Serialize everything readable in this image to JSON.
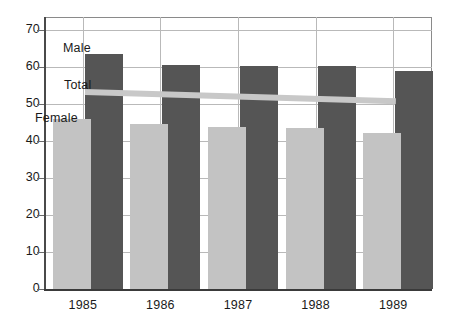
{
  "chart_data": {
    "type": "bar",
    "title": "",
    "subtitle": "",
    "xlabel": "",
    "ylabel": "",
    "categories": [
      "1985",
      "1986",
      "1987",
      "1988",
      "1989"
    ],
    "ylim": [
      0,
      70
    ],
    "yticks": [
      0,
      10,
      20,
      30,
      40,
      50,
      60,
      70
    ],
    "ytick_labels": [
      "0",
      "10",
      "20",
      "30",
      "40",
      "50",
      "60",
      "70"
    ],
    "grid": true,
    "legend_position": "inline-annotations",
    "series": [
      {
        "name": "Male",
        "type": "bar",
        "color": "#555555",
        "values": [
          63.5,
          60.5,
          60.3,
          60.2,
          58.8
        ]
      },
      {
        "name": "Female",
        "type": "bar",
        "color": "#c3c3c3",
        "values": [
          46.0,
          44.5,
          43.7,
          43.5,
          42.3
        ]
      },
      {
        "name": "Total",
        "type": "line",
        "color": "#c8c8c8",
        "values": [
          53.4,
          52.8,
          52.2,
          51.5,
          50.9
        ]
      }
    ],
    "annotations": [
      {
        "text": "Male",
        "series": "Male"
      },
      {
        "text": "Total",
        "series": "Total"
      },
      {
        "text": "Female",
        "series": "Female"
      }
    ]
  },
  "axis": {
    "y_tick_labels": [
      "70",
      "60",
      "50",
      "40",
      "30",
      "20",
      "10",
      "0"
    ],
    "x_tick_labels": [
      "1985",
      "1986",
      "1987",
      "1988",
      "1989"
    ]
  },
  "labels": {
    "male": "Male",
    "total": "Total",
    "female": "Female"
  }
}
